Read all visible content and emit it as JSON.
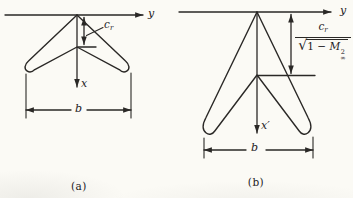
{
  "panel_a": {
    "caption": "(a)",
    "y_axis_label": "y",
    "x_axis_label": "x",
    "root_chord": {
      "base": "c",
      "sub": "r"
    },
    "span_label": "b"
  },
  "panel_b": {
    "caption": "(b)",
    "y_axis_label": "y",
    "x_axis_label": "x′",
    "root_chord_fraction": {
      "numerator_base": "c",
      "numerator_sub": "r",
      "radical": "√",
      "radicand_prefix": "1 − ",
      "mach_base": "M",
      "mach_sup": "2",
      "mach_sub": "∞"
    },
    "span_label": "b"
  },
  "colors": {
    "ink": "#2a2826",
    "paper": "#fbfaf5"
  }
}
